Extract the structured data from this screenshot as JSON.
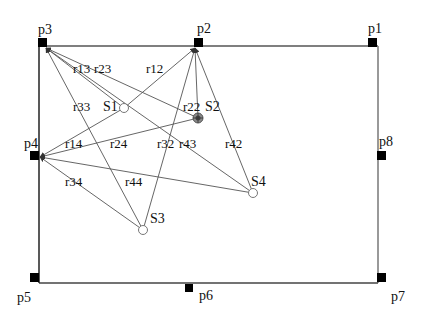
{
  "diagram": {
    "room_outline_color": "#555555",
    "ray_color": "#555555",
    "marker_color": "#000000",
    "receivers": [
      {
        "id": "p1",
        "label": "p1"
      },
      {
        "id": "p2",
        "label": "p2"
      },
      {
        "id": "p3",
        "label": "p3"
      },
      {
        "id": "p4",
        "label": "p4"
      },
      {
        "id": "p5",
        "label": "p5"
      },
      {
        "id": "p6",
        "label": "p6"
      },
      {
        "id": "p7",
        "label": "p7"
      },
      {
        "id": "p8",
        "label": "p8"
      }
    ],
    "sources": [
      {
        "id": "S1",
        "label": "S1",
        "style": "open-circle"
      },
      {
        "id": "S2",
        "label": "S2",
        "style": "target-circle"
      },
      {
        "id": "S3",
        "label": "S3",
        "style": "open-circle"
      },
      {
        "id": "S4",
        "label": "S4",
        "style": "open-circle"
      }
    ],
    "rays": [
      {
        "label": "r13",
        "from": "S1",
        "to": "p3"
      },
      {
        "label": "r12",
        "from": "S1",
        "to": "p2"
      },
      {
        "label": "r14",
        "from": "S1",
        "to": "p4"
      },
      {
        "label": "r23",
        "from": "S2",
        "to": "p3"
      },
      {
        "label": "r22",
        "from": "S2",
        "to": "p2"
      },
      {
        "label": "r24",
        "from": "S2",
        "to": "p4"
      },
      {
        "label": "r33",
        "from": "S3",
        "to": "p3"
      },
      {
        "label": "r32",
        "from": "S3",
        "to": "p2"
      },
      {
        "label": "r34",
        "from": "S3",
        "to": "p4"
      },
      {
        "label": "r43",
        "from": "S4",
        "to": "p3"
      },
      {
        "label": "r42",
        "from": "S4",
        "to": "p2"
      },
      {
        "label": "r44",
        "from": "S4",
        "to": "p4"
      }
    ]
  }
}
